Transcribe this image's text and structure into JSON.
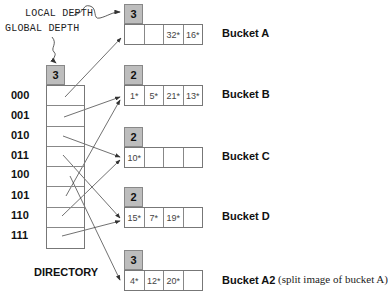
{
  "annotations": {
    "local_depth": "LOCAL DEPTH",
    "global_depth": "GLOBAL DEPTH"
  },
  "directory": {
    "global_depth": "3",
    "label": "DIRECTORY",
    "entries": [
      {
        "key": "000",
        "points_to": "Bucket A"
      },
      {
        "key": "001",
        "points_to": "Bucket B"
      },
      {
        "key": "010",
        "points_to": "Bucket C"
      },
      {
        "key": "011",
        "points_to": "Bucket D"
      },
      {
        "key": "100",
        "points_to": "Bucket A2"
      },
      {
        "key": "101",
        "points_to": "Bucket B"
      },
      {
        "key": "110",
        "points_to": "Bucket C"
      },
      {
        "key": "111",
        "points_to": "Bucket D"
      }
    ]
  },
  "buckets": [
    {
      "name": "Bucket A",
      "local_depth": "3",
      "slots": [
        "",
        "",
        "32*",
        "16*"
      ],
      "note": ""
    },
    {
      "name": "Bucket B",
      "local_depth": "2",
      "slots": [
        "1*",
        "5*",
        "21*",
        "13*"
      ],
      "note": ""
    },
    {
      "name": "Bucket C",
      "local_depth": "2",
      "slots": [
        "10*",
        "",
        "",
        ""
      ],
      "note": ""
    },
    {
      "name": "Bucket D",
      "local_depth": "2",
      "slots": [
        "15*",
        "7*",
        "19*",
        ""
      ],
      "note": ""
    },
    {
      "name": "Bucket A2",
      "local_depth": "3",
      "slots": [
        "4*",
        "12*",
        "20*",
        ""
      ],
      "note": "(split image of bucket A)"
    }
  ],
  "colors": {
    "depth_fill": "#bdbdbd",
    "border": "#777777",
    "arrow": "#333333"
  }
}
